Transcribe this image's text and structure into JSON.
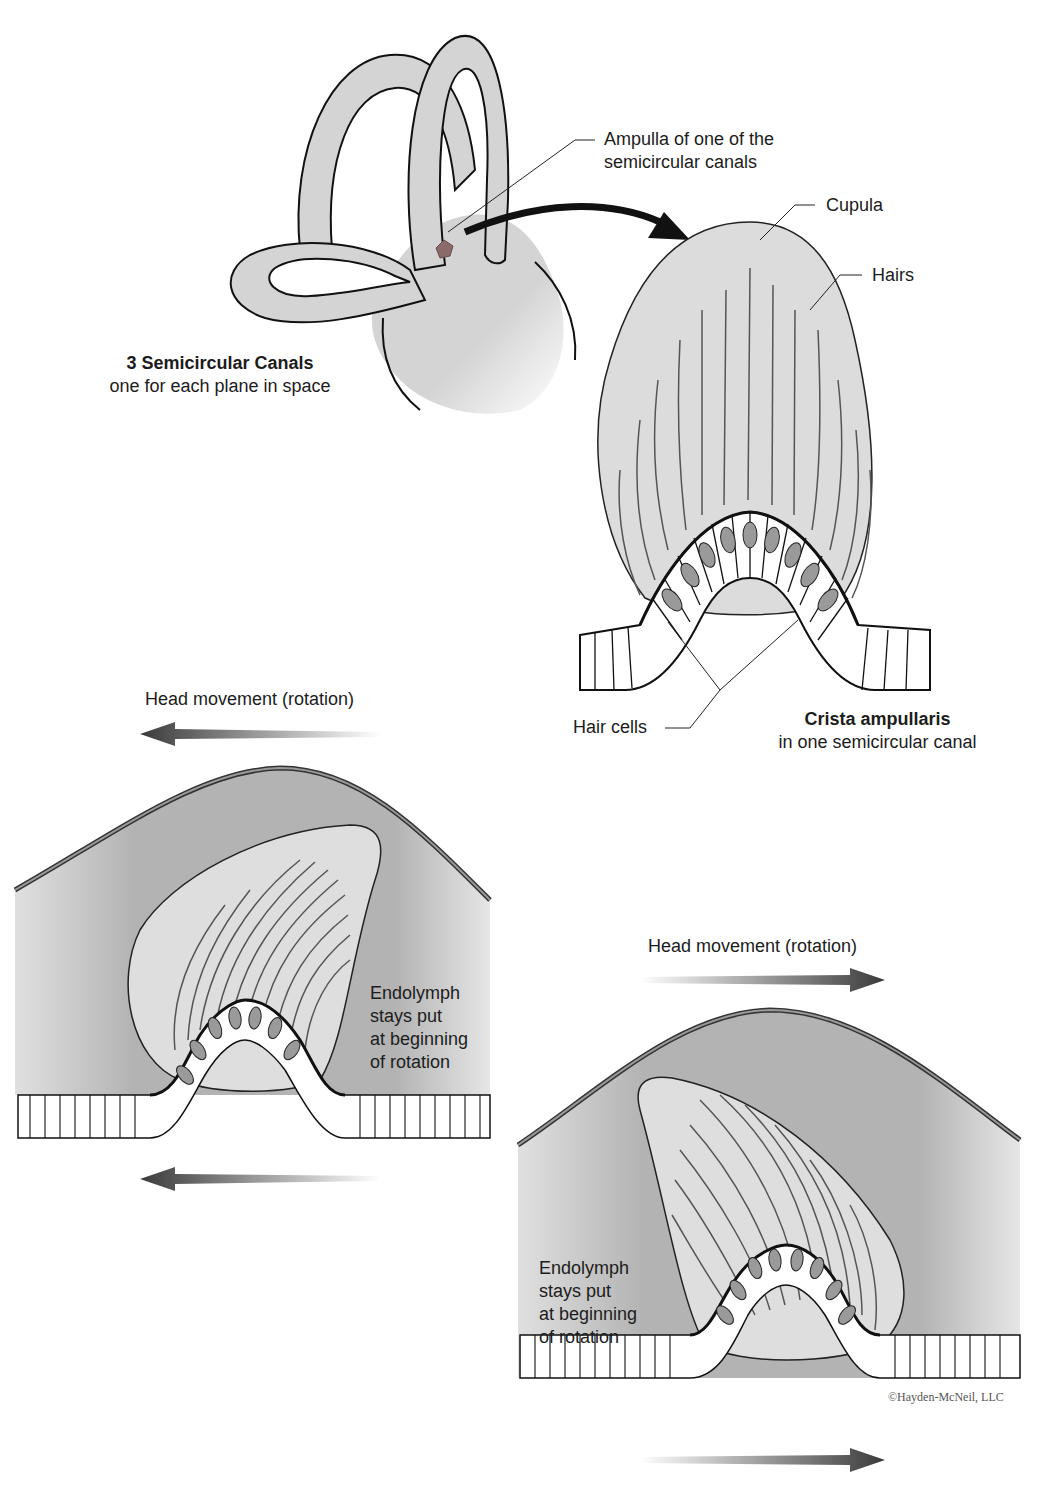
{
  "semicircular_canals": {
    "title": "3 Semicircular Canals",
    "subtitle": "one for each plane in space",
    "ampulla_label_line1": "Ampulla of one of the",
    "ampulla_label_line2": "semicircular canals"
  },
  "crista": {
    "cupula_label": "Cupula",
    "hairs_label": "Hairs",
    "hair_cells_label": "Hair cells",
    "title": "Crista ampullaris",
    "subtitle": "in one semicircular canal"
  },
  "panel_left": {
    "head_movement_label": "Head movement (rotation)",
    "direction": "left",
    "endolymph_lines": [
      "Endolymph",
      "stays put",
      "at beginning",
      "of rotation"
    ]
  },
  "panel_right": {
    "head_movement_label": "Head movement (rotation)",
    "direction": "right",
    "endolymph_lines": [
      "Endolymph",
      "stays put",
      "at beginning",
      "of rotation"
    ]
  },
  "credit": "©Hayden-McNeil, LLC",
  "colors": {
    "canal_fill": "#d6d6d6",
    "cupula_fill": "#dcdcdc",
    "endolymph_fill": "#b5b5b5",
    "hair_cell_fill": "#9a9a9a",
    "ampulla_marker": "#8a6a6a",
    "outline": "#111111"
  }
}
